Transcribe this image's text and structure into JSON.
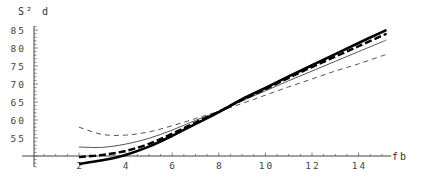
{
  "chart_data": {
    "type": "line",
    "title": "",
    "ylabel": "S² d",
    "xlabel": "fb",
    "xlim": [
      0,
      15.2
    ],
    "ylim": [
      50,
      86
    ],
    "x_axis_crosses_y_at": 50,
    "grid": false,
    "legend": null,
    "x_ticks": [
      2,
      4,
      6,
      8,
      10,
      12,
      14
    ],
    "y_ticks": [
      55,
      60,
      65,
      70,
      75,
      80,
      85
    ],
    "x": [
      2,
      3,
      4,
      5,
      6,
      7,
      8,
      9,
      10,
      11,
      12,
      13,
      14,
      15
    ],
    "series": [
      {
        "name": "thick solid",
        "style": "solid",
        "width": 2.6,
        "color": "#000000",
        "values": [
          47.8,
          48.8,
          50.3,
          52.6,
          55.6,
          58.9,
          62.2,
          65.8,
          68.9,
          72.1,
          75.2,
          78.3,
          81.4,
          84.4
        ]
      },
      {
        "name": "thick dashed",
        "style": "dashed",
        "width": 2.4,
        "color": "#000000",
        "values": [
          49.7,
          50.3,
          51.4,
          53.4,
          56.2,
          59.3,
          62.3,
          65.6,
          68.6,
          71.7,
          74.7,
          77.6,
          80.5,
          83.4
        ]
      },
      {
        "name": "thin solid",
        "style": "solid",
        "width": 1.0,
        "color": "#555555",
        "values": [
          52.5,
          52.4,
          53.3,
          54.9,
          57.2,
          59.9,
          62.4,
          65.3,
          68.1,
          70.9,
          73.6,
          76.3,
          79.0,
          81.7
        ]
      },
      {
        "name": "thin dashed",
        "style": "dashed",
        "width": 1.0,
        "color": "#555555",
        "values": [
          58.0,
          56.0,
          55.8,
          56.7,
          58.4,
          60.4,
          62.4,
          64.6,
          66.9,
          69.2,
          71.4,
          73.6,
          75.6,
          77.8
        ]
      }
    ]
  },
  "axes": {
    "y_title": "S² d",
    "x_title": "fb",
    "y_tick_labels": [
      "55",
      "60",
      "65",
      "70",
      "75",
      "80",
      "85"
    ],
    "x_tick_labels": [
      "2",
      "4",
      "6",
      "8",
      "10",
      "12",
      "14"
    ]
  }
}
